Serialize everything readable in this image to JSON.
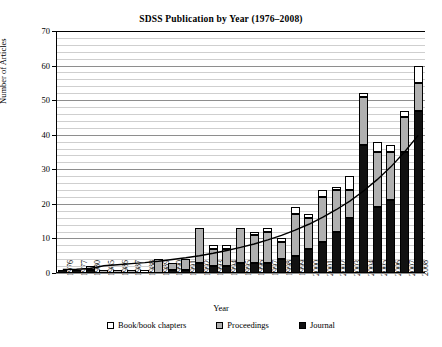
{
  "chart_data": {
    "type": "bar",
    "title": "SDSS Publication by Year (1976–2008)",
    "xlabel": "Year",
    "ylabel": "Number of Articles",
    "ylim": [
      0,
      70
    ],
    "ytick_step": 10,
    "yticks": [
      0,
      10,
      20,
      30,
      40,
      50,
      60,
      70
    ],
    "grid": "horizontal-minor-and-major",
    "legend_position": "bottom-center",
    "stacked": true,
    "stack_order_bottom_to_top": [
      "Journal",
      "Proceedings",
      "Book/book chapters"
    ],
    "categories": [
      "1976",
      "1977",
      "1980",
      "1985",
      "1986",
      "1987",
      "1988",
      "1989",
      "1990",
      "1991",
      "1992",
      "1993",
      "1994",
      "1995",
      "1996",
      "1997",
      "1998",
      "1999",
      "2000",
      "2001",
      "2002",
      "2003",
      "2004",
      "2005",
      "2006",
      "2007",
      "2008"
    ],
    "series": [
      {
        "name": "Journal",
        "color": "#111111",
        "values": [
          1,
          1,
          1,
          0,
          0,
          0,
          0,
          0,
          1,
          1,
          3,
          2,
          2,
          3,
          3,
          3,
          4,
          5,
          7,
          9,
          12,
          16,
          37,
          19,
          21,
          35,
          47
        ]
      },
      {
        "name": "Proceedings",
        "color": "#b0b0b0",
        "values": [
          0,
          0,
          1,
          1,
          1,
          1,
          0,
          4,
          2,
          3,
          10,
          5,
          5,
          10,
          8,
          9,
          5,
          12,
          9,
          13,
          12,
          8,
          14,
          16,
          14,
          10,
          8
        ]
      },
      {
        "name": "Book/book chapters",
        "color": "#ffffff",
        "values": [
          0,
          0,
          0,
          0,
          0,
          0,
          1,
          0,
          0,
          0,
          0,
          1,
          1,
          0,
          1,
          1,
          1,
          2,
          1,
          2,
          1,
          4,
          1,
          3,
          2,
          2,
          5
        ]
      }
    ],
    "totals": [
      1,
      1,
      2,
      1,
      1,
      1,
      1,
      4,
      3,
      4,
      13,
      8,
      8,
      13,
      12,
      13,
      10,
      19,
      17,
      24,
      25,
      28,
      52,
      38,
      37,
      47,
      60
    ],
    "trend_line": {
      "style": "solid-black-exponential-fit",
      "values": [
        1.0,
        1.1,
        1.3,
        2.1,
        2.4,
        2.7,
        3.0,
        3.4,
        3.9,
        4.4,
        5.0,
        5.7,
        6.5,
        7.4,
        8.4,
        9.6,
        10.9,
        12.4,
        14.1,
        16.1,
        18.3,
        20.8,
        23.7,
        27.0,
        30.7,
        35.0,
        39.8
      ]
    }
  },
  "legend": {
    "items": [
      {
        "label": "Book/book chapters",
        "swatch": "book"
      },
      {
        "label": "Proceedings",
        "swatch": "proceedings"
      },
      {
        "label": "Journal",
        "swatch": "journal"
      }
    ]
  }
}
